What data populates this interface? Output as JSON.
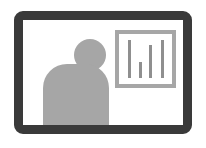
{
  "icon": {
    "name": "video-presentation-icon",
    "colors": {
      "frame": "#3a3a3a",
      "person": "#a6a6a6",
      "chart_border": "#a6a6a6",
      "bars": "#8f8f8f",
      "background": "#ffffff"
    },
    "chart_bars": [
      {
        "x": 13,
        "height": 38
      },
      {
        "x": 24,
        "height": 16
      },
      {
        "x": 34,
        "height": 33
      },
      {
        "x": 46,
        "height": 38
      }
    ]
  }
}
